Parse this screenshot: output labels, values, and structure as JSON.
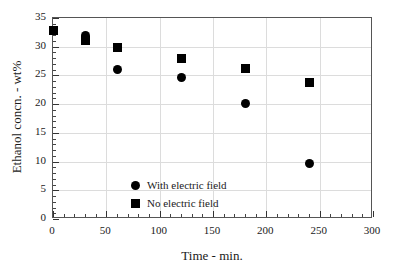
{
  "chart_data": {
    "type": "scatter",
    "title": "",
    "xlabel": "Time - min.",
    "ylabel": "Ethanol concn. - wt%",
    "xlim": [
      0,
      300
    ],
    "ylim": [
      0,
      35
    ],
    "xticks": [
      0,
      50,
      100,
      150,
      200,
      250,
      300
    ],
    "yticks": [
      0,
      5,
      10,
      15,
      20,
      25,
      30,
      35
    ],
    "xtick_labels": [
      "0",
      "50",
      "100",
      "150",
      "200",
      "250",
      "300"
    ],
    "ytick_labels": [
      "0",
      "5",
      "10",
      "15",
      "20",
      "25",
      "30",
      "35"
    ],
    "x_minor_step": 10,
    "y_minor_step": 1,
    "grid": true,
    "grid_color": "#dcdcdc",
    "axis_color": "#555555",
    "marker_color": "#000000",
    "background": "#ffffff",
    "legend_position": "inside-lower-left",
    "series": [
      {
        "name": "With electric field",
        "marker": "circle",
        "color": "#000000",
        "x": [
          30,
          60,
          120,
          180,
          240
        ],
        "y": [
          32.0,
          26.1,
          24.6,
          20.1,
          9.6
        ]
      },
      {
        "name": "No electric field",
        "marker": "square",
        "color": "#000000",
        "x": [
          0,
          30,
          60,
          120,
          180,
          240
        ],
        "y": [
          32.8,
          31.0,
          29.8,
          28.0,
          26.2,
          23.8
        ]
      }
    ]
  },
  "legend": {
    "items": [
      {
        "label": "With electric field",
        "marker": "circle"
      },
      {
        "label": "No electric field",
        "marker": "square"
      }
    ]
  }
}
